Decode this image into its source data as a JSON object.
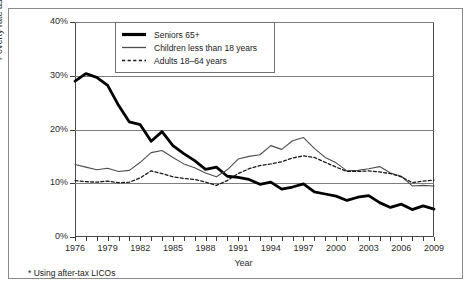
{
  "figure": {
    "ylabel": "Poverty rate as a percentage*",
    "xlabel": "Year",
    "footnote": "* Using after-tax LICOs"
  },
  "legend": {
    "items": [
      {
        "label": "Seniors 65+",
        "style": "thick-solid",
        "color": "#000000"
      },
      {
        "label": "Children less than 18 years",
        "style": "thin-solid",
        "color": "#4d4d4d"
      },
      {
        "label": "Adults 18–64 years",
        "style": "dashed",
        "color": "#1a1a1a"
      }
    ]
  },
  "chart_data": {
    "type": "line",
    "title": "",
    "xlabel": "Year",
    "ylabel": "Poverty rate as a percentage*",
    "footnote": "* Using after-tax LICOs",
    "grid": true,
    "legend_position": "top-left-inside",
    "xlim": [
      1976,
      2009
    ],
    "ylim": [
      0,
      40
    ],
    "ytick_labels": [
      "0%",
      "10%",
      "20%",
      "30%",
      "40%"
    ],
    "ytick_values": [
      0,
      10,
      20,
      30,
      40
    ],
    "xtick_labels": [
      "1976",
      "1979",
      "1982",
      "1985",
      "1988",
      "1991",
      "1994",
      "1997",
      "2000",
      "2003",
      "2006",
      "2009"
    ],
    "xtick_values": [
      1976,
      1979,
      1982,
      1985,
      1988,
      1991,
      1994,
      1997,
      2000,
      2003,
      2006,
      2009
    ],
    "x": [
      1976,
      1977,
      1978,
      1979,
      1980,
      1981,
      1982,
      1983,
      1984,
      1985,
      1986,
      1987,
      1988,
      1989,
      1990,
      1991,
      1992,
      1993,
      1994,
      1995,
      1996,
      1997,
      1998,
      1999,
      2000,
      2001,
      2002,
      2003,
      2004,
      2005,
      2006,
      2007,
      2008,
      2009
    ],
    "series": [
      {
        "name": "Seniors 65+",
        "style": "thick-solid",
        "color": "#000000",
        "values": [
          29.0,
          30.4,
          29.7,
          28.2,
          24.5,
          21.4,
          20.9,
          17.8,
          19.6,
          17.0,
          15.5,
          14.2,
          12.6,
          13.0,
          11.3,
          11.1,
          10.7,
          9.8,
          10.2,
          8.9,
          9.3,
          9.9,
          8.4,
          8.0,
          7.6,
          6.8,
          7.4,
          7.7,
          6.4,
          5.5,
          6.1,
          5.1,
          5.8,
          5.2
        ]
      },
      {
        "name": "Children less than 18 years",
        "style": "thin-solid",
        "color": "#4d4d4d",
        "values": [
          13.5,
          13.0,
          12.5,
          12.8,
          12.2,
          12.4,
          13.9,
          15.7,
          16.1,
          14.8,
          13.6,
          12.9,
          11.9,
          11.2,
          12.5,
          14.5,
          15.0,
          15.3,
          17.0,
          16.3,
          17.9,
          18.5,
          16.5,
          14.8,
          13.8,
          12.3,
          12.4,
          12.7,
          13.1,
          11.9,
          11.3,
          9.5,
          9.6,
          9.5
        ]
      },
      {
        "name": "Adults 18–64 years",
        "style": "dashed",
        "color": "#1a1a1a",
        "values": [
          10.5,
          10.3,
          10.2,
          10.4,
          10.1,
          10.2,
          11.0,
          12.3,
          11.8,
          11.2,
          10.9,
          10.7,
          10.2,
          9.6,
          10.5,
          11.8,
          12.7,
          13.3,
          13.6,
          14.0,
          14.7,
          15.1,
          14.8,
          13.9,
          13.0,
          12.2,
          12.2,
          12.3,
          12.1,
          11.8,
          11.2,
          10.1,
          10.4,
          10.6
        ]
      }
    ]
  }
}
